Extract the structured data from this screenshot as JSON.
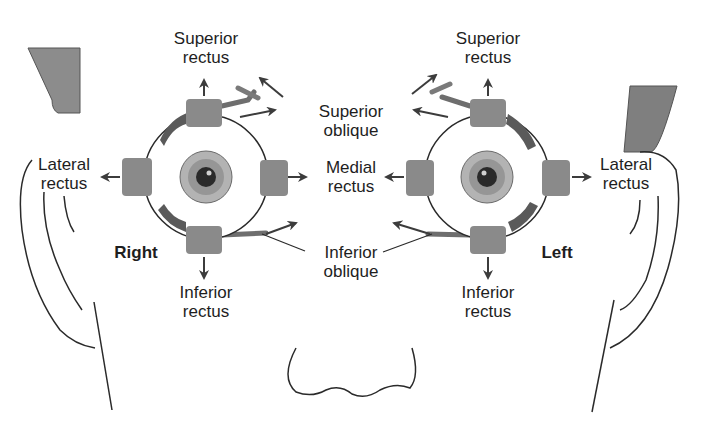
{
  "figure": {
    "type": "anatomical-diagram",
    "colors": {
      "muscle": "#8a8a8a",
      "arrow": "#3c3c3c",
      "outline": "#2a2a2a",
      "iris_outer": "#a8a8a8",
      "iris_inner": "#8c8c8c",
      "pupil": "#2a2a2a",
      "background": "#ffffff"
    }
  },
  "eyes": {
    "right": {
      "side_label": "Right",
      "labels": {
        "superior_rectus": [
          "Superior",
          "rectus"
        ],
        "lateral_rectus": [
          "Lateral",
          "rectus"
        ],
        "inferior_rectus": [
          "Inferior",
          "rectus"
        ]
      }
    },
    "left": {
      "side_label": "Left",
      "labels": {
        "superior_rectus": [
          "Superior",
          "rectus"
        ],
        "lateral_rectus": [
          "Lateral",
          "rectus"
        ],
        "inferior_rectus": [
          "Inferior",
          "rectus"
        ]
      }
    }
  },
  "shared_labels": {
    "superior_oblique": [
      "Superior",
      "oblique"
    ],
    "medial_rectus": [
      "Medial",
      "rectus"
    ],
    "inferior_oblique": [
      "Inferior",
      "oblique"
    ]
  }
}
